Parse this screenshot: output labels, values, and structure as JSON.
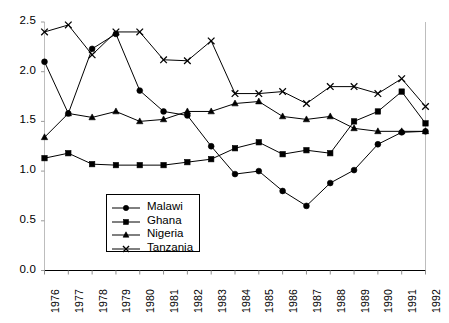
{
  "chart_data": {
    "type": "line",
    "title": "",
    "subtitle": "",
    "xlabel": "",
    "ylabel": "",
    "categories": [
      "1976",
      "1977",
      "1978",
      "1979",
      "1980",
      "1981",
      "1982",
      "1983",
      "1984",
      "1985",
      "1986",
      "1987",
      "1988",
      "1989",
      "1990",
      "1991",
      "1992"
    ],
    "x_tick_labels": [
      "1976",
      "1977",
      "1978",
      "1979",
      "1980",
      "1981",
      "1982",
      "1983",
      "1984",
      "1985",
      "1986",
      "1987",
      "1988",
      "1989",
      "1990",
      "1991",
      "1992"
    ],
    "y_tick_labels": [
      "0.0",
      "0.5",
      "1.0",
      "1.5",
      "2.0",
      "2.5"
    ],
    "y_ticks": [
      0.0,
      0.5,
      1.0,
      1.5,
      2.0,
      2.5
    ],
    "ylim": [
      0.0,
      2.5
    ],
    "xlim_labels": [
      "1976",
      "1992"
    ],
    "grid": false,
    "legend_position": "lower-left-inside",
    "series": [
      {
        "name": "Malawi",
        "marker": "circle",
        "color": "#000000",
        "values": [
          2.1,
          1.58,
          2.23,
          2.38,
          1.81,
          1.6,
          1.56,
          1.25,
          0.97,
          1.0,
          0.8,
          0.65,
          0.88,
          1.01,
          1.27,
          1.39,
          1.4
        ]
      },
      {
        "name": "Ghana",
        "marker": "square",
        "color": "#000000",
        "values": [
          1.13,
          1.18,
          1.07,
          1.06,
          1.06,
          1.06,
          1.09,
          1.12,
          1.23,
          1.29,
          1.17,
          1.21,
          1.18,
          1.5,
          1.6,
          1.8,
          1.48
        ]
      },
      {
        "name": "Nigeria",
        "marker": "triangle",
        "color": "#000000",
        "values": [
          1.34,
          1.58,
          1.54,
          1.6,
          1.5,
          1.52,
          1.6,
          1.6,
          1.68,
          1.7,
          1.55,
          1.52,
          1.55,
          1.43,
          1.4,
          1.4,
          1.4
        ]
      },
      {
        "name": "Tanzania",
        "marker": "cross",
        "color": "#000000",
        "values": [
          2.4,
          2.47,
          2.17,
          2.4,
          2.4,
          2.12,
          2.11,
          2.31,
          1.78,
          1.78,
          1.8,
          1.68,
          1.85,
          1.85,
          1.78,
          1.93,
          1.65
        ]
      }
    ]
  },
  "legend": {
    "items": [
      {
        "label": "Malawi",
        "marker": "circle"
      },
      {
        "label": "Ghana",
        "marker": "square"
      },
      {
        "label": "Nigeria",
        "marker": "triangle"
      },
      {
        "label": "Tanzania",
        "marker": "cross"
      }
    ]
  },
  "colors": {
    "line": "#000000",
    "axis": "#000000",
    "background": "#ffffff"
  }
}
